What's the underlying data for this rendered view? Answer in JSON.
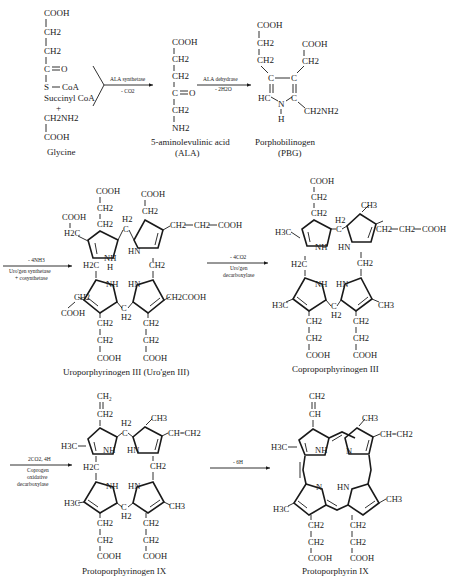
{
  "colors": {
    "ink": "#1a1a1a",
    "background": "#ffffff"
  },
  "row1": {
    "succinyl_coa": {
      "groups": [
        "COOH",
        "CH2",
        "CH2",
        "C",
        "=O",
        "S",
        "CoA"
      ],
      "name": "Succinyl CoA"
    },
    "plus": "+",
    "glycine": {
      "groups": [
        "CH2NH2",
        "COOH"
      ],
      "name": "Glycine"
    },
    "arrow1": {
      "enzyme": "ALA synthetase",
      "byproduct": "- CO2"
    },
    "ala": {
      "groups": [
        "COOH",
        "CH2",
        "CH2",
        "C",
        "=O",
        "CH2",
        "NH2"
      ],
      "name": "5-aminolevulinic acid",
      "abbr": "(ALA)"
    },
    "arrow2": {
      "enzyme": "ALA dehydrase",
      "byproduct": "- 2H2O"
    },
    "pbg": {
      "groups": [
        "COOH",
        "CH2",
        "CH2",
        "C",
        "C",
        "COOH",
        "CH2",
        "HC",
        "N",
        "H",
        "C",
        "CH2NH2"
      ],
      "name": "Porphobilinogen",
      "abbr": "(PBG)"
    }
  },
  "row2": {
    "arrow3": {
      "byproduct": "- 4NH3",
      "enzyme_line1": "Uro'gen synthetase",
      "enzyme_line2": "+ cosynthetase"
    },
    "uro": {
      "name": "Uroporphyrinogen III (Uro'gen III)",
      "labels": [
        "COOH",
        "CH2",
        "CH2",
        "COOH",
        "CH2",
        "COOH",
        "H2C",
        "H2",
        "C",
        "NH",
        "H",
        "HN",
        "CH2",
        "CH2",
        "COOH",
        "H2C",
        "CH2",
        "NH",
        "HN",
        "CH2COOH",
        "CH2",
        "COOH",
        "C",
        "H2",
        "CH2",
        "CH2",
        "CH2",
        "CH2",
        "COOH",
        "COOH"
      ]
    },
    "arrow4": {
      "byproduct": "- 4CO2",
      "enzyme_line1": "Uro'gen",
      "enzyme_line2": "decarboxylase"
    },
    "copro": {
      "name": "Coproporphyrinogen III",
      "labels": [
        "COOH",
        "CH2",
        "CH2",
        "CH3",
        "H3C",
        "H2",
        "C",
        "NH",
        "HN",
        "CH2",
        "CH2",
        "COOH",
        "H2C",
        "CH2",
        "NH",
        "HN",
        "H3C",
        "CH3",
        "C",
        "H2",
        "CH2",
        "CH2",
        "CH2",
        "CH2",
        "COOH",
        "COOH"
      ]
    }
  },
  "row3": {
    "arrow5": {
      "byproduct": "2CO2, 4H",
      "enzyme_line1": "Coprogen",
      "enzyme_line2": "oxidative",
      "enzyme_line3": "decarboxylase"
    },
    "protogen": {
      "name": "Protoporphyrinogen IX",
      "labels": [
        "CH2",
        "CH2",
        "CH3",
        "H3C",
        "H2",
        "C",
        "NH",
        "HN",
        "CH=CH2",
        "H2C",
        "CH2",
        "NH",
        "HN",
        "H3C",
        "CH3",
        "C",
        "H2",
        "CH2",
        "CH2",
        "CH2",
        "CH2",
        "COOH",
        "COOH"
      ]
    },
    "arrow6": {
      "byproduct": "- 6H"
    },
    "proto": {
      "name": "Protoporphyrin IX",
      "labels": [
        "CH2",
        "CH",
        "CH3",
        "H3C",
        "NH",
        "N",
        "CH=CH2",
        "N",
        "HN",
        "H3C",
        "CH3",
        "CH2",
        "CH2",
        "CH2",
        "CH2",
        "COOH",
        "COOH"
      ]
    }
  }
}
